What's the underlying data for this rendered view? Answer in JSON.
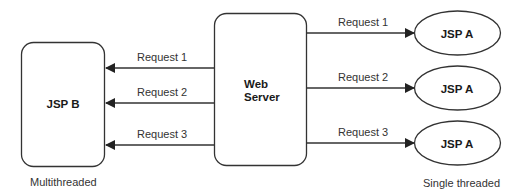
{
  "diagram": {
    "web_server": {
      "label_line1": "Web",
      "label_line2": "Server"
    },
    "multithreaded": {
      "node_label": "JSP B",
      "caption": "Multithreaded",
      "requests": [
        {
          "label": "Request 1"
        },
        {
          "label": "Request 2"
        },
        {
          "label": "Request 3"
        }
      ]
    },
    "single_threaded": {
      "caption": "Single threaded",
      "instances": [
        {
          "request_label": "Request 1",
          "node_label": "JSP A"
        },
        {
          "request_label": "Request 2",
          "node_label": "JSP A"
        },
        {
          "request_label": "Request 3",
          "node_label": "JSP A"
        }
      ]
    },
    "colors": {
      "stroke": "#333333",
      "text": "#1a1a1a",
      "background": "#ffffff"
    }
  }
}
